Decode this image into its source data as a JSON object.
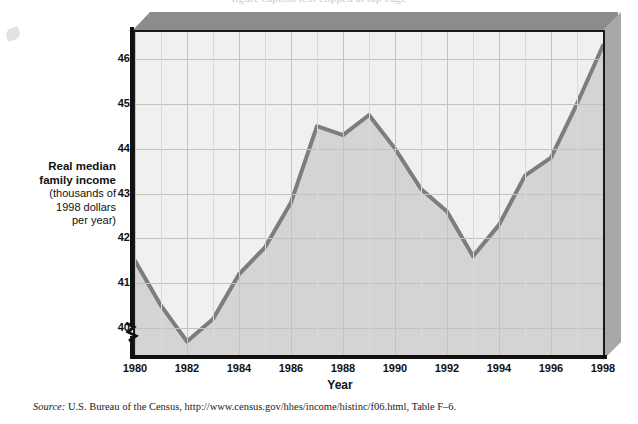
{
  "top_caption": "figure caption text clipped at top edge",
  "axis": {
    "y_title_line1": "Real median",
    "y_title_line2": "family income",
    "y_title_line3": "(thousands of",
    "y_title_line4": "1998 dollars",
    "y_title_line5": "per year)",
    "x_title": "Year",
    "y_ticks": [
      "40",
      "41",
      "42",
      "43",
      "44",
      "45",
      "46"
    ],
    "x_ticks": [
      "1980",
      "1982",
      "1984",
      "1986",
      "1988",
      "1990",
      "1992",
      "1994",
      "1996",
      "1998"
    ]
  },
  "source": {
    "label": "Source:",
    "text": " U.S. Bureau of the Census, ",
    "url": "http://www.census.gov/hhes/income/histinc/f06.html",
    "tail": ", Table F–6."
  },
  "colors": {
    "line": "#7d7d7d",
    "fill_below": "#d4d4d4",
    "fill_above": "#f0f0f0",
    "grid": "#c2c2c2",
    "frame": "#1a1a1a",
    "block_top": "#8c8c8c",
    "block_side": "#a8a8a8"
  },
  "chart_data": {
    "type": "line",
    "title": "",
    "xlabel": "Year",
    "ylabel": "Real median family income (thousands of 1998 dollars per year)",
    "xlim": [
      1980,
      1998
    ],
    "ylim": [
      39.4,
      46.6
    ],
    "grid": true,
    "legend": "none",
    "x": [
      1980,
      1981,
      1982,
      1983,
      1984,
      1985,
      1986,
      1987,
      1988,
      1989,
      1990,
      1991,
      1992,
      1993,
      1994,
      1995,
      1996,
      1997,
      1998
    ],
    "values": [
      41.5,
      40.5,
      39.7,
      40.2,
      41.2,
      41.8,
      42.8,
      44.5,
      44.3,
      44.75,
      44.0,
      43.1,
      42.6,
      41.6,
      42.3,
      43.4,
      43.8,
      45.0,
      46.3
    ],
    "series": [
      {
        "name": "Real median family income",
        "values": [
          41.5,
          40.5,
          39.7,
          40.2,
          41.2,
          41.8,
          42.8,
          44.5,
          44.3,
          44.75,
          44.0,
          43.1,
          42.6,
          41.6,
          42.3,
          43.4,
          43.8,
          45.0,
          46.3
        ]
      }
    ],
    "y_tick_values": [
      40,
      41,
      42,
      43,
      44,
      45,
      46
    ],
    "x_tick_values": [
      1980,
      1982,
      1984,
      1986,
      1988,
      1990,
      1992,
      1994,
      1996,
      1998
    ],
    "y_axis_break": true
  }
}
